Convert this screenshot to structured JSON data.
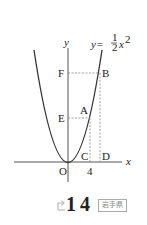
{
  "figure": {
    "equation": {
      "lhs": "y=",
      "numerator": "1",
      "denominator": "2",
      "var": "x",
      "exp": "2"
    },
    "axis_labels": {
      "x": "x",
      "y": "y"
    },
    "points": {
      "O": "O",
      "A": "A",
      "B": "B",
      "C": "C",
      "D": "D",
      "E": "E",
      "F": "F"
    },
    "tick_label": "4",
    "colors": {
      "curve": "#333333",
      "axis": "#555555",
      "dashed": "#888888"
    }
  },
  "footer": {
    "problem_number": "14",
    "region_badge": "岩手県",
    "icon": "arrow-icon"
  }
}
